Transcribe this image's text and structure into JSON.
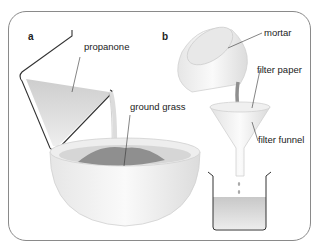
{
  "diagram": {
    "panels": [
      {
        "letter": "a",
        "labels": {
          "propanone": "propanone",
          "ground_grass": "ground grass"
        }
      },
      {
        "letter": "b",
        "labels": {
          "mortar": "mortar",
          "filter_paper": "filter paper",
          "filter_funnel": "filter funnel"
        }
      }
    ]
  }
}
